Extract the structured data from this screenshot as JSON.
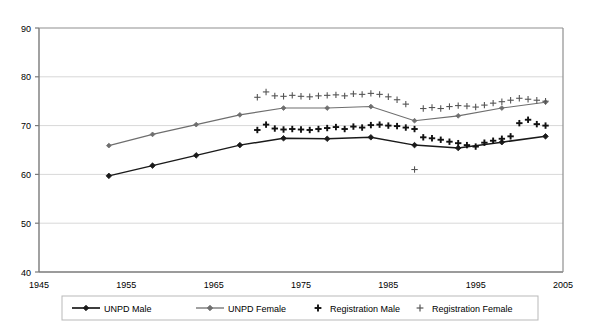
{
  "chart_data": {
    "type": "line",
    "title": "",
    "xlabel": "",
    "ylabel": "",
    "xlim": [
      1945,
      2005
    ],
    "ylim": [
      40,
      90
    ],
    "xticks": [
      1945,
      1955,
      1965,
      1975,
      1985,
      1995,
      2005
    ],
    "yticks": [
      40,
      50,
      60,
      70,
      80,
      90
    ],
    "grid": "horizontal",
    "legend_position": "bottom",
    "series": [
      {
        "name": "UNPD Male",
        "marker": "diamond",
        "color": "#1a1a1a",
        "line": "solid",
        "x": [
          1953,
          1958,
          1963,
          1968,
          1973,
          1978,
          1983,
          1988,
          1993,
          1998,
          2003
        ],
        "values": [
          59.7,
          61.8,
          63.9,
          66.0,
          67.4,
          67.3,
          67.6,
          66.0,
          65.4,
          66.6,
          67.8
        ]
      },
      {
        "name": "UNPD Female",
        "marker": "diamond",
        "color": "#6e6e6e",
        "line": "solid",
        "x": [
          1953,
          1958,
          1963,
          1968,
          1973,
          1978,
          1983,
          1988,
          1993,
          1998,
          2003
        ],
        "values": [
          65.9,
          68.2,
          70.2,
          72.2,
          73.6,
          73.6,
          73.9,
          71.0,
          72.0,
          73.6,
          74.8
        ]
      },
      {
        "name": "Registration Male",
        "marker": "plus-bold",
        "color": "#111111",
        "line": "none",
        "x": [
          1970,
          1971,
          1972,
          1973,
          1974,
          1975,
          1976,
          1977,
          1978,
          1979,
          1980,
          1981,
          1982,
          1983,
          1984,
          1985,
          1986,
          1987,
          1988,
          1989,
          1990,
          1991,
          1992,
          1993,
          1994,
          1995,
          1996,
          1997,
          1998,
          1999,
          2000,
          2001,
          2002,
          2003
        ],
        "values": [
          69.1,
          70.2,
          69.4,
          69.2,
          69.3,
          69.2,
          69.1,
          69.3,
          69.5,
          69.7,
          69.3,
          69.8,
          69.6,
          70.1,
          70.2,
          70.0,
          69.9,
          69.6,
          69.3,
          67.6,
          67.4,
          67.1,
          66.7,
          66.4,
          66.0,
          65.7,
          66.5,
          66.9,
          67.3,
          67.8,
          70.5,
          71.2,
          70.3,
          70.0
        ]
      },
      {
        "name": "Registration Female",
        "marker": "plus-thin",
        "color": "#555555",
        "line": "none",
        "x": [
          1970,
          1971,
          1972,
          1973,
          1974,
          1975,
          1976,
          1977,
          1978,
          1979,
          1980,
          1981,
          1982,
          1983,
          1984,
          1985,
          1986,
          1987,
          1988,
          1989,
          1990,
          1991,
          1992,
          1993,
          1994,
          1995,
          1996,
          1997,
          1998,
          1999,
          2000,
          2001,
          2002,
          2003
        ],
        "values": [
          75.8,
          76.9,
          76.1,
          76.0,
          76.2,
          76.0,
          75.9,
          76.1,
          76.2,
          76.3,
          76.1,
          76.5,
          76.4,
          76.6,
          76.4,
          75.9,
          75.3,
          74.4,
          61.0,
          73.5,
          73.7,
          73.5,
          73.9,
          74.1,
          74.0,
          73.8,
          74.2,
          74.6,
          74.9,
          75.2,
          75.6,
          75.4,
          75.2,
          75.0
        ]
      }
    ]
  },
  "legend": {
    "items": [
      {
        "label": "UNPD Male"
      },
      {
        "label": "UNPD Female"
      },
      {
        "label": "Registration Male"
      },
      {
        "label": "Registration Female"
      }
    ]
  }
}
